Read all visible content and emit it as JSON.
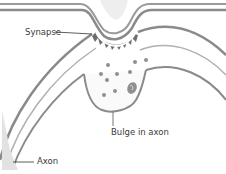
{
  "diagram": {
    "labels": {
      "synapse": "Synapse",
      "bulge": "Bulge in axon",
      "axon": "Axon"
    },
    "colors": {
      "membrane": "#8a8a8a",
      "membrane_light": "#d6d6d6",
      "synapse_teeth": "#6b6b6b",
      "vesicle": "#8f8f8f",
      "background": "#ffffff"
    }
  }
}
